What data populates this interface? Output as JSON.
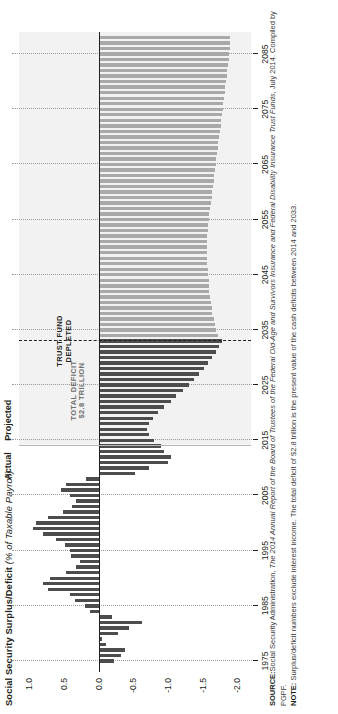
{
  "figure": {
    "title": "Social Security Surplus/Deficit",
    "title_sub": "(% of Taxable Payroll)"
  },
  "axes": {
    "y_label": "",
    "y_ticks": [
      "1.0",
      "0.5",
      "0.0",
      "-0.5",
      "-1.0",
      "-1.5",
      "-2.0"
    ],
    "y_values": [
      1.0,
      0.5,
      0.0,
      -0.5,
      -1.0,
      -1.5,
      -2.0
    ],
    "ylim": [
      -2.2,
      1.15
    ],
    "x_ticks": [
      "1975",
      "1985",
      "1995",
      "2005",
      "2015",
      "2025",
      "2035",
      "2045",
      "2055",
      "2065",
      "2075",
      "2085"
    ],
    "xlim": [
      1973,
      2089
    ]
  },
  "regions": {
    "actual_label": "Actual",
    "projected_label": "Projected",
    "actual_projected_split_year": 2014
  },
  "annotations": {
    "trust_fund": "TRUST FUND\nDEPLETED",
    "trust_fund_year": 2033,
    "total_deficit": "TOTAL DEFICIT\n$2.8 TRILLION"
  },
  "colors": {
    "bar_dark": "#4d4d4d",
    "bar_light": "#a9a9a9",
    "projected_band": "#f2f2f2",
    "axis": "#231f20",
    "grid": "#9a9a9a"
  },
  "footnotes": {
    "source_label": "SOURCE:",
    "source_text": "Social Security Administration, ",
    "source_italic": "The 2014 Annual Report of the Board of Trustees of the Federal Old-Age and Survivors Insurance and Federal Disability Insurance Trust Funds,",
    "source_tail": " July 2014. Compiled by PGPF.",
    "note_label": "NOTE:",
    "note_text": "Surplus/deficit numbers exclude interest income. The total deficit of $2.8 trillion is the present value of the cash deficits between 2014 and 2033."
  },
  "chart_data": {
    "type": "bar",
    "title": "Social Security Surplus/Deficit (% of Taxable Payroll)",
    "xlabel": "",
    "ylabel": "% of Taxable Payroll",
    "ylim": [
      -2.2,
      1.15
    ],
    "grid": true,
    "legend": "none",
    "orientation": "vertical-rotated",
    "series": [
      {
        "name": "Surplus/Deficit (% of taxable payroll)",
        "x": [
          1975,
          1976,
          1977,
          1978,
          1979,
          1980,
          1981,
          1982,
          1983,
          1984,
          1985,
          1986,
          1987,
          1988,
          1989,
          1990,
          1991,
          1992,
          1993,
          1994,
          1995,
          1996,
          1997,
          1998,
          1999,
          2000,
          2001,
          2002,
          2003,
          2004,
          2005,
          2006,
          2007,
          2008,
          2009,
          2010,
          2011,
          2012,
          2013,
          2014,
          2015,
          2016,
          2017,
          2018,
          2019,
          2020,
          2021,
          2022,
          2023,
          2024,
          2025,
          2026,
          2027,
          2028,
          2029,
          2030,
          2031,
          2032,
          2033,
          2034,
          2035,
          2036,
          2037,
          2038,
          2039,
          2040,
          2041,
          2042,
          2043,
          2044,
          2045,
          2046,
          2047,
          2048,
          2049,
          2050,
          2051,
          2052,
          2053,
          2054,
          2055,
          2056,
          2057,
          2058,
          2059,
          2060,
          2061,
          2062,
          2063,
          2064,
          2065,
          2066,
          2067,
          2068,
          2069,
          2070,
          2071,
          2072,
          2073,
          2074,
          2075,
          2076,
          2077,
          2078,
          2079,
          2080,
          2081,
          2082,
          2083,
          2084,
          2085,
          2086,
          2087,
          2088
        ],
        "values": [
          -0.22,
          -0.33,
          -0.38,
          -0.1,
          -0.05,
          -0.28,
          -0.44,
          -0.62,
          -0.2,
          0.12,
          0.2,
          0.34,
          0.42,
          0.73,
          0.81,
          0.7,
          0.47,
          0.33,
          0.27,
          0.4,
          0.41,
          0.48,
          0.62,
          0.8,
          0.95,
          0.9,
          0.73,
          0.52,
          0.38,
          0.33,
          0.42,
          0.55,
          0.47,
          0.18,
          -0.52,
          -0.72,
          -1.0,
          -1.05,
          -0.95,
          -0.9,
          -0.8,
          -0.72,
          -0.7,
          -0.72,
          -0.78,
          -0.86,
          -0.95,
          -1.04,
          -1.12,
          -1.22,
          -1.3,
          -1.38,
          -1.45,
          -1.52,
          -1.58,
          -1.64,
          -1.7,
          -1.74,
          -1.78,
          -1.72,
          -1.7,
          -1.68,
          -1.66,
          -1.64,
          -1.63,
          -1.62,
          -1.61,
          -1.6,
          -1.6,
          -1.59,
          -1.58,
          -1.58,
          -1.57,
          -1.57,
          -1.57,
          -1.57,
          -1.57,
          -1.57,
          -1.58,
          -1.58,
          -1.59,
          -1.6,
          -1.61,
          -1.62,
          -1.63,
          -1.64,
          -1.65,
          -1.66,
          -1.67,
          -1.68,
          -1.69,
          -1.7,
          -1.71,
          -1.72,
          -1.73,
          -1.74,
          -1.75,
          -1.76,
          -1.77,
          -1.78,
          -1.79,
          -1.8,
          -1.81,
          -1.82,
          -1.83,
          -1.84,
          -1.85,
          -1.86,
          -1.87,
          -1.88,
          -1.88,
          -1.89,
          -1.89,
          -1.9
        ]
      }
    ],
    "annotations": [
      {
        "text": "TRUST FUND DEPLETED",
        "x": 2033,
        "type": "dashed-vline"
      },
      {
        "text": "TOTAL DEFICIT $2.8 TRILLION",
        "x": 2024,
        "type": "region-label"
      },
      {
        "text": "Actual",
        "x": 1995,
        "type": "band-label"
      },
      {
        "text": "Projected",
        "x": 2050,
        "type": "band-label"
      }
    ]
  }
}
